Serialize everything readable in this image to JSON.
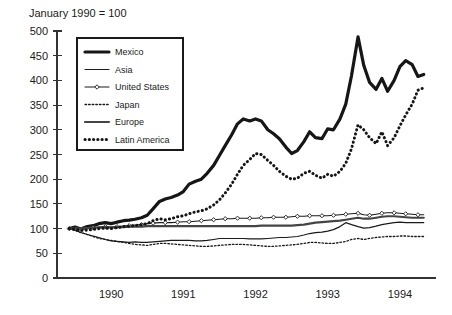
{
  "chart_data": {
    "type": "line",
    "title": "January 1990 = 100",
    "xlabel": "",
    "ylabel": "",
    "ylim": [
      0,
      500
    ],
    "ytick_step": 50,
    "yticks": [
      0,
      50,
      100,
      150,
      200,
      250,
      300,
      350,
      400,
      450,
      500
    ],
    "ytick_labels": [
      "0",
      "50",
      "100",
      "150",
      "200",
      "250",
      "300",
      "350",
      "400",
      "450",
      "500"
    ],
    "xticks": [
      1990,
      1991,
      1992,
      1993,
      1994
    ],
    "xtick_labels": [
      "1990",
      "1991",
      "1992",
      "1993",
      "1994"
    ],
    "xlim": [
      1989.75,
      1995.0
    ],
    "grid": false,
    "legend_position": "upper-left-inside",
    "x": [
      1989.92,
      1990.0,
      1990.08,
      1990.17,
      1990.25,
      1990.33,
      1990.42,
      1990.5,
      1990.58,
      1990.67,
      1990.75,
      1990.83,
      1990.92,
      1991.0,
      1991.08,
      1991.17,
      1991.25,
      1991.33,
      1991.42,
      1991.5,
      1991.58,
      1991.67,
      1991.75,
      1991.83,
      1991.92,
      1992.0,
      1992.08,
      1992.17,
      1992.25,
      1992.33,
      1992.42,
      1992.5,
      1992.58,
      1992.67,
      1992.75,
      1992.83,
      1992.92,
      1993.0,
      1993.08,
      1993.17,
      1993.25,
      1993.33,
      1993.42,
      1993.5,
      1993.58,
      1993.67,
      1993.75,
      1993.83,
      1993.92,
      1994.0,
      1994.08,
      1994.17,
      1994.25,
      1994.33,
      1994.42,
      1994.5,
      1994.58,
      1994.67,
      1994.75,
      1994.83
    ],
    "series": [
      {
        "name": "Mexico",
        "style": "thick-solid",
        "color": "#161616",
        "width": 3.2,
        "values": [
          100,
          103,
          99,
          104,
          106,
          110,
          112,
          110,
          113,
          116,
          117,
          119,
          122,
          127,
          140,
          155,
          160,
          163,
          168,
          175,
          190,
          196,
          200,
          212,
          228,
          248,
          268,
          290,
          312,
          322,
          318,
          322,
          318,
          300,
          292,
          282,
          265,
          252,
          258,
          276,
          296,
          284,
          282,
          302,
          300,
          322,
          352,
          410,
          488,
          430,
          396,
          382,
          404,
          378,
          400,
          428,
          440,
          432,
          408,
          412
        ]
      },
      {
        "name": "Asia",
        "style": "thin-solid",
        "color": "#1a1a1a",
        "width": 1.2,
        "values": [
          100,
          97,
          92,
          88,
          85,
          82,
          78,
          75,
          74,
          73,
          72,
          73,
          72,
          72,
          73,
          74,
          75,
          76,
          76,
          76,
          76,
          75,
          75,
          76,
          78,
          80,
          80,
          80,
          80,
          80,
          79,
          79,
          79,
          80,
          81,
          82,
          82,
          83,
          84,
          87,
          90,
          92,
          93,
          95,
          98,
          104,
          112,
          108,
          104,
          101,
          102,
          105,
          108,
          110,
          112,
          113,
          112,
          112,
          112,
          112
        ]
      },
      {
        "name": "United States",
        "style": "thin-solid-marker",
        "color": "#1a1a1a",
        "width": 1.1,
        "marker": "diamond",
        "values": [
          100,
          101,
          99,
          100,
          102,
          103,
          104,
          103,
          104,
          105,
          106,
          107,
          108,
          110,
          111,
          112,
          112,
          112,
          113,
          114,
          114,
          115,
          116,
          117,
          118,
          119,
          120,
          120,
          121,
          121,
          121,
          121,
          122,
          122,
          123,
          123,
          123,
          124,
          125,
          125,
          126,
          126,
          126,
          126,
          127,
          128,
          129,
          130,
          131,
          128,
          127,
          129,
          131,
          132,
          132,
          131,
          130,
          129,
          128,
          128
        ]
      },
      {
        "name": "Japan",
        "style": "fine-dotted",
        "color": "#1a1a1a",
        "width": 1.3,
        "values": [
          100,
          96,
          92,
          88,
          84,
          80,
          78,
          76,
          74,
          72,
          70,
          68,
          67,
          66,
          68,
          70,
          70,
          69,
          68,
          67,
          66,
          65,
          64,
          64,
          65,
          66,
          67,
          68,
          68,
          68,
          67,
          66,
          65,
          64,
          64,
          65,
          66,
          67,
          68,
          70,
          72,
          72,
          71,
          70,
          70,
          72,
          74,
          78,
          80,
          78,
          80,
          82,
          83,
          84,
          84,
          85,
          85,
          84,
          84,
          84
        ]
      },
      {
        "name": "Europe",
        "style": "medium-solid",
        "color": "#444444",
        "width": 2.2,
        "values": [
          100,
          101,
          100,
          101,
          102,
          102,
          103,
          102,
          103,
          103,
          104,
          104,
          104,
          105,
          105,
          105,
          105,
          105,
          105,
          105,
          105,
          105,
          105,
          105,
          105,
          105,
          105,
          105,
          105,
          105,
          105,
          105,
          106,
          106,
          106,
          106,
          106,
          106,
          107,
          108,
          110,
          112,
          113,
          114,
          115,
          116,
          118,
          120,
          122,
          120,
          120,
          122,
          124,
          125,
          125,
          124,
          123,
          122,
          122,
          122
        ]
      },
      {
        "name": "Latin America",
        "style": "thick-dotted",
        "color": "#161616",
        "width": 3.0,
        "values": [
          100,
          99,
          96,
          97,
          98,
          100,
          101,
          100,
          102,
          104,
          105,
          106,
          108,
          110,
          116,
          120,
          118,
          120,
          124,
          126,
          130,
          134,
          136,
          140,
          148,
          158,
          172,
          190,
          210,
          228,
          240,
          252,
          250,
          238,
          228,
          216,
          206,
          200,
          202,
          212,
          216,
          208,
          202,
          210,
          206,
          216,
          232,
          262,
          310,
          300,
          284,
          272,
          296,
          268,
          284,
          308,
          330,
          352,
          380,
          385
        ]
      }
    ]
  },
  "legend": {
    "items": [
      {
        "label": "Mexico",
        "sample": "thick-solid"
      },
      {
        "label": "Asia",
        "sample": "thin-solid"
      },
      {
        "label": "United States",
        "sample": "thin-solid-marker"
      },
      {
        "label": "Japan",
        "sample": "fine-dotted"
      },
      {
        "label": "Europe",
        "sample": "medium-solid"
      },
      {
        "label": "Latin America",
        "sample": "thick-dotted"
      }
    ]
  },
  "colors": {
    "background": "#ffffff",
    "axis": "#333333",
    "text": "#1a1a1a",
    "europe_gray": "#444444"
  }
}
